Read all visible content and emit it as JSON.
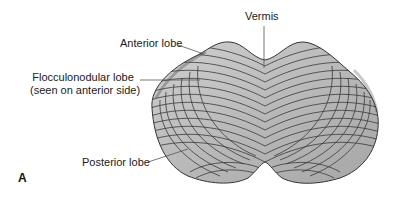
{
  "figure": {
    "panel_letter": "A",
    "colors": {
      "fill": "#b8b8b8",
      "fill_light": "#d2d2d2",
      "folia_line": "#3a3a3a",
      "leader_line": "#555555",
      "text": "#1a1a1a"
    }
  },
  "labels": {
    "vermis": "Vermis",
    "anterior_lobe": "Anterior lobe",
    "flocculonodular_line1": "Flocculonodular lobe",
    "flocculonodular_line2": "(seen on anterior side)",
    "posterior_lobe": "Posterior lobe"
  }
}
